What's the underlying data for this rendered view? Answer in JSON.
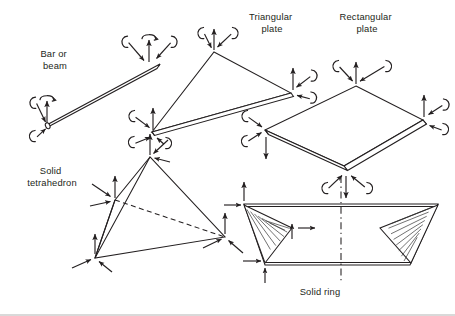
{
  "figure": {
    "background_color": "#ffffff",
    "line_color": "#231f20",
    "hatch_color": "#3a3a3a",
    "width": 455,
    "height": 316
  },
  "labels": {
    "bar_or_beam": "Bar or\nbeam",
    "bar_or_beam_line1": "Bar or",
    "bar_or_beam_line2": "beam",
    "triangular_plate_line1": "Triangular",
    "triangular_plate_line2": "plate",
    "rectangular_plate_line1": "Rectangular",
    "rectangular_plate_line2": "plate",
    "solid_tetrahedron_line1": "Solid",
    "solid_tetrahedron_line2": "tetrahedron",
    "solid_ring": "Solid ring"
  },
  "elements": [
    {
      "name": "bar-or-beam",
      "label": "Bar or beam",
      "nodes": 2,
      "dof_per_node": {
        "translations": 1,
        "rotations": 3
      },
      "symbols_at_node": [
        "straight-arrow-up",
        "curved-rotation-arrow",
        "c-rotation-symbol",
        "c-rotation-symbol"
      ]
    },
    {
      "name": "triangular-plate",
      "label": "Triangular plate",
      "nodes": 3,
      "dof_per_node": {
        "translations": 1,
        "rotations": 2
      },
      "symbols_at_node": [
        "straight-arrow-up",
        "straight-arrow-diagonal",
        "c-rotation-symbol",
        "c-rotation-symbol"
      ]
    },
    {
      "name": "rectangular-plate",
      "label": "Rectangular plate",
      "nodes": 4,
      "dof_per_node": {
        "translations": 1,
        "rotations": 2
      },
      "symbols_at_node": [
        "straight-arrow-up",
        "straight-arrow-diagonal",
        "c-rotation-symbol",
        "c-rotation-symbol"
      ]
    },
    {
      "name": "solid-tetrahedron",
      "label": "Solid tetrahedron",
      "nodes": 4,
      "dof_per_node": {
        "translations": 3,
        "rotations": 0
      },
      "symbols_at_node": [
        "straight-arrow-up",
        "straight-arrow-diagonal",
        "straight-arrow-diagonal"
      ]
    },
    {
      "name": "solid-ring",
      "label": "Solid ring",
      "nodes": 3,
      "dof_per_node": {
        "translations": 2,
        "rotations": 0
      },
      "symbols_at_node": [
        "straight-arrow-up",
        "straight-arrow-right"
      ],
      "features": [
        "hatched-cross-section",
        "axis-of-revolution-centerline"
      ]
    }
  ],
  "label_positions": {
    "bar_or_beam": {
      "x": 55,
      "y": 57
    },
    "triangular_plate": {
      "x": 272,
      "y": 20
    },
    "rectangular_plate": {
      "x": 367,
      "y": 20
    },
    "solid_tetrahedron": {
      "x": 52,
      "y": 174
    },
    "solid_ring": {
      "x": 320,
      "y": 292
    }
  }
}
